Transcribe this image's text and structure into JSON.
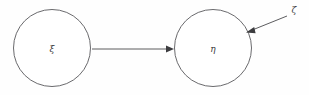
{
  "diagram": {
    "type": "path-diagram",
    "background_color": "#fefefe",
    "stroke_color": "#59595c",
    "text_color": "#3a3a3a",
    "nodes": [
      {
        "id": "xi",
        "label": "ξ",
        "shape": "circle",
        "cx": 52,
        "cy": 48,
        "r": 39
      },
      {
        "id": "eta",
        "label": "η",
        "shape": "circle",
        "cx": 213,
        "cy": 48,
        "r": 39
      }
    ],
    "edges": [
      {
        "id": "xi-to-eta",
        "from": "xi",
        "to": "eta",
        "label": "",
        "style": "straight-arrow",
        "x1": 92,
        "y1": 49,
        "x2": 173,
        "y2": 49
      },
      {
        "id": "zeta-to-eta",
        "from": "zeta",
        "to": "eta",
        "label": "ζ",
        "style": "straight-arrow",
        "x1": 287,
        "y1": 16,
        "x2": 246,
        "y2": 32
      }
    ],
    "labels": [
      {
        "id": "zeta-label",
        "text": "ζ",
        "x": 294,
        "y": 10
      }
    ]
  }
}
